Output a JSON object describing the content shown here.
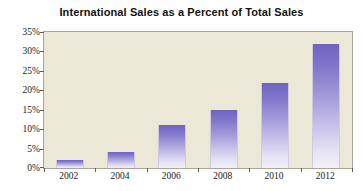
{
  "chart_data": {
    "type": "bar",
    "title": "International Sales as a Percent of Total Sales",
    "xlabel": "",
    "ylabel": "",
    "categories": [
      "2002",
      "2004",
      "2006",
      "2008",
      "2010",
      "2012"
    ],
    "values": [
      2,
      4,
      11,
      15,
      22,
      32
    ],
    "ylim": [
      0,
      35
    ],
    "ytick_values": [
      0,
      5,
      10,
      15,
      20,
      25,
      30,
      35
    ],
    "ytick_labels": [
      "0%",
      "5%",
      "10%",
      "15%",
      "20%",
      "25%",
      "30%",
      "35%"
    ],
    "grid": false,
    "legend": false,
    "series": [
      {
        "name": "International Sales as a Percent of Total Sales",
        "values": [
          2,
          4,
          11,
          15,
          22,
          32
        ]
      }
    ],
    "colors": {
      "bar_top": "#6f63c0",
      "bar_bottom": "#f2f0f7",
      "plot_background": "#ece8d8",
      "figure_background": "#ffffff",
      "axis_line": "#a8a59a",
      "text": "#1a1a1a"
    }
  }
}
